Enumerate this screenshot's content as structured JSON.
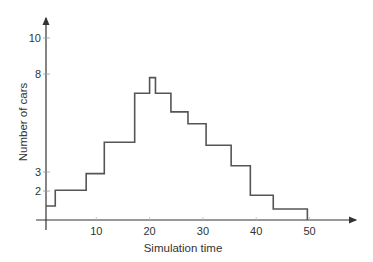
{
  "chart_data": {
    "type": "line",
    "subtype": "step",
    "title": "",
    "xlabel": "Simulation time",
    "ylabel": "Number of cars",
    "xlim": [
      0,
      55
    ],
    "ylim": [
      0,
      10.5
    ],
    "x_ticks": [
      10,
      20,
      30,
      40,
      50
    ],
    "y_ticks": [
      2,
      3,
      8,
      10
    ],
    "grid": false,
    "legend": null,
    "steps": [
      {
        "x_start": 0,
        "x_end": 2.3,
        "value": 1.25
      },
      {
        "x_start": 2.3,
        "x_end": 8.1,
        "value": 2.05
      },
      {
        "x_start": 8.1,
        "x_end": 11.5,
        "value": 2.9
      },
      {
        "x_start": 11.5,
        "x_end": 17.2,
        "value": 4.5
      },
      {
        "x_start": 17.2,
        "x_end": 20.0,
        "value": 7.0
      },
      {
        "x_start": 20.0,
        "x_end": 21.1,
        "value": 7.8
      },
      {
        "x_start": 21.1,
        "x_end": 24.0,
        "value": 7.0
      },
      {
        "x_start": 24.0,
        "x_end": 27.2,
        "value": 6.05
      },
      {
        "x_start": 27.2,
        "x_end": 30.6,
        "value": 5.45
      },
      {
        "x_start": 30.6,
        "x_end": 35.3,
        "value": 4.35
      },
      {
        "x_start": 35.3,
        "x_end": 38.9,
        "value": 3.3
      },
      {
        "x_start": 38.9,
        "x_end": 43.2,
        "value": 1.8
      },
      {
        "x_start": 43.2,
        "x_end": 49.6,
        "value": 1.1
      }
    ],
    "line_color": "#555555",
    "axis_color": "#333333"
  }
}
